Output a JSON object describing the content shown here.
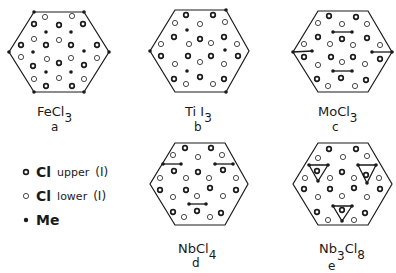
{
  "legend": {
    "items": [
      {
        "symbol": "bold-ring",
        "label_main": "Cl",
        "label_sub": "upper",
        "label_roman": "(I)"
      },
      {
        "symbol": "open-ring",
        "label_main": "Cl",
        "label_sub": "lower",
        "label_roman": "(I)"
      },
      {
        "symbol": "filled-dot",
        "label_main": "Me",
        "label_sub": "",
        "label_roman": ""
      }
    ]
  },
  "panels": [
    {
      "id": "a",
      "formula_main": "FeCl",
      "formula_sub": "3",
      "letter": "a",
      "origin": [
        0,
        0
      ],
      "hexagon": [
        [
          34,
          12
        ],
        [
          84,
          12
        ],
        [
          109,
          52
        ],
        [
          84,
          92
        ],
        [
          34,
          92
        ],
        [
          9,
          52
        ]
      ],
      "vertex_dots": [
        [
          34,
          12
        ],
        [
          84,
          12
        ],
        [
          109,
          52
        ],
        [
          84,
          92
        ],
        [
          34,
          92
        ],
        [
          9,
          52
        ]
      ],
      "bold": [
        [
          34,
          24
        ],
        [
          59,
          25
        ],
        [
          83,
          24
        ],
        [
          21,
          45
        ],
        [
          46,
          45
        ],
        [
          71,
          45
        ],
        [
          97,
          45
        ],
        [
          33,
          66
        ],
        [
          59,
          63
        ],
        [
          84,
          65
        ],
        [
          46,
          86
        ],
        [
          72,
          86
        ]
      ],
      "open": [
        [
          45,
          17
        ],
        [
          72,
          16
        ],
        [
          34,
          39
        ],
        [
          59,
          40
        ],
        [
          21,
          57
        ],
        [
          47,
          59
        ],
        [
          71,
          58
        ],
        [
          97,
          58
        ],
        [
          34,
          79
        ],
        [
          59,
          78
        ],
        [
          84,
          79
        ]
      ],
      "filled": [
        [
          46,
          32
        ],
        [
          71,
          32
        ],
        [
          33,
          52
        ],
        [
          84,
          51
        ],
        [
          46,
          72
        ],
        [
          71,
          72
        ]
      ],
      "bonds": [],
      "triangles": []
    },
    {
      "id": "b",
      "formula_main": "Ti I",
      "formula_sub": "3",
      "letter": "b",
      "origin": [
        140,
        0
      ],
      "hexagon": [
        [
          35,
          10
        ],
        [
          86,
          10
        ],
        [
          109,
          51
        ],
        [
          86,
          92
        ],
        [
          35,
          92
        ],
        [
          10,
          51
        ]
      ],
      "vertex_dots": [
        [
          86,
          10
        ],
        [
          10,
          51
        ],
        [
          86,
          92
        ]
      ],
      "bold": [
        [
          46,
          15
        ],
        [
          73,
          15
        ],
        [
          34,
          37
        ],
        [
          60,
          39
        ],
        [
          84,
          37
        ],
        [
          21,
          56
        ],
        [
          48,
          56
        ],
        [
          71,
          56
        ],
        [
          98,
          56
        ],
        [
          34,
          79
        ],
        [
          60,
          77
        ],
        [
          84,
          79
        ]
      ],
      "open": [
        [
          35,
          23
        ],
        [
          60,
          24
        ],
        [
          85,
          22
        ],
        [
          21,
          44
        ],
        [
          49,
          44
        ],
        [
          71,
          43
        ],
        [
          97,
          44
        ],
        [
          35,
          64
        ],
        [
          60,
          62
        ],
        [
          84,
          64
        ],
        [
          46,
          84
        ],
        [
          73,
          84
        ]
      ],
      "filled": [
        [
          47,
          30
        ],
        [
          85,
          50
        ],
        [
          47,
          71
        ]
      ],
      "bonds": [],
      "triangles": []
    },
    {
      "id": "c",
      "formula_main": "MoCl",
      "formula_sub": "3",
      "letter": "c",
      "origin": [
        285,
        0
      ],
      "hexagon": [
        [
          33,
          11
        ],
        [
          83,
          11
        ],
        [
          107,
          52
        ],
        [
          83,
          92
        ],
        [
          33,
          92
        ],
        [
          8,
          52
        ]
      ],
      "vertex_dots": [
        [
          8,
          52
        ],
        [
          107,
          52
        ]
      ],
      "bold": [
        [
          44,
          16
        ],
        [
          71,
          17
        ],
        [
          33,
          37
        ],
        [
          57,
          39
        ],
        [
          82,
          38
        ],
        [
          19,
          57
        ],
        [
          46,
          57
        ],
        [
          68,
          57
        ],
        [
          95,
          59
        ],
        [
          32,
          79
        ],
        [
          56,
          78
        ],
        [
          81,
          80
        ]
      ],
      "open": [
        [
          33,
          23
        ],
        [
          57,
          24
        ],
        [
          82,
          24
        ],
        [
          19,
          44
        ],
        [
          45,
          44
        ],
        [
          68,
          45
        ],
        [
          95,
          45
        ],
        [
          33,
          65
        ],
        [
          57,
          62
        ],
        [
          80,
          64
        ],
        [
          43,
          86
        ],
        [
          70,
          86
        ]
      ],
      "filled": [
        [
          48,
          32
        ],
        [
          67,
          32
        ],
        [
          27,
          51
        ],
        [
          87,
          52
        ],
        [
          48,
          71
        ],
        [
          67,
          71
        ]
      ],
      "bonds": [
        [
          [
            48,
            32
          ],
          [
            67,
            32
          ]
        ],
        [
          [
            8,
            52
          ],
          [
            27,
            51
          ]
        ],
        [
          [
            87,
            52
          ],
          [
            107,
            52
          ]
        ],
        [
          [
            48,
            71
          ],
          [
            67,
            71
          ]
        ]
      ],
      "triangles": []
    },
    {
      "id": "d",
      "formula_main": "NbCl",
      "formula_sub": "4",
      "letter": "d",
      "origin": [
        140,
        135
      ],
      "hexagon": [
        [
          35,
          8
        ],
        [
          85,
          8
        ],
        [
          108,
          49
        ],
        [
          85,
          90
        ],
        [
          35,
          90
        ],
        [
          10,
          49
        ]
      ],
      "vertex_dots": [],
      "bold": [
        [
          45,
          13
        ],
        [
          71,
          13
        ],
        [
          34,
          36
        ],
        [
          58,
          37
        ],
        [
          83,
          35
        ],
        [
          20,
          55
        ],
        [
          46,
          55
        ],
        [
          70,
          53
        ],
        [
          96,
          55
        ],
        [
          33,
          77
        ],
        [
          57,
          76
        ],
        [
          81,
          78
        ]
      ],
      "open": [
        [
          33,
          20
        ],
        [
          58,
          22
        ],
        [
          82,
          20
        ],
        [
          20,
          43
        ],
        [
          46,
          43
        ],
        [
          69,
          43
        ],
        [
          96,
          43
        ],
        [
          33,
          62
        ],
        [
          57,
          61
        ],
        [
          83,
          61
        ],
        [
          44,
          82
        ],
        [
          70,
          82
        ]
      ],
      "filled": [
        [
          23,
          29
        ],
        [
          41,
          29
        ],
        [
          75,
          29
        ],
        [
          93,
          29
        ],
        [
          49,
          69
        ],
        [
          66,
          69
        ]
      ],
      "bonds": [
        [
          [
            23,
            29
          ],
          [
            41,
            29
          ]
        ],
        [
          [
            75,
            29
          ],
          [
            93,
            29
          ]
        ],
        [
          [
            49,
            69
          ],
          [
            66,
            69
          ]
        ]
      ],
      "triangles": []
    },
    {
      "id": "e",
      "formula_main": "Nb",
      "formula_sub_mid": "3",
      "formula_main2": "Cl",
      "formula_sub": "8",
      "letter": "e",
      "origin": [
        285,
        135
      ],
      "hexagon": [
        [
          33,
          8
        ],
        [
          83,
          8
        ],
        [
          107,
          49
        ],
        [
          83,
          90
        ],
        [
          33,
          90
        ],
        [
          8,
          49
        ]
      ],
      "vertex_dots": [],
      "bold": [
        [
          44,
          14
        ],
        [
          71,
          14
        ],
        [
          32,
          36
        ],
        [
          57,
          37
        ],
        [
          81,
          40
        ],
        [
          19,
          54
        ],
        [
          45,
          54
        ],
        [
          69,
          53
        ],
        [
          95,
          54
        ],
        [
          32,
          77
        ],
        [
          57,
          75
        ],
        [
          80,
          78
        ]
      ],
      "open": [
        [
          33,
          23
        ],
        [
          58,
          22
        ],
        [
          82,
          21
        ],
        [
          20,
          43
        ],
        [
          45,
          43
        ],
        [
          69,
          43
        ],
        [
          94,
          43
        ],
        [
          33,
          62
        ],
        [
          57,
          61
        ],
        [
          82,
          62
        ],
        [
          43,
          85
        ],
        [
          69,
          85
        ]
      ],
      "filled": [],
      "bonds": [],
      "triangles": [
        [
          [
            24,
            30
          ],
          [
            43,
            30
          ],
          [
            33,
            46
          ]
        ],
        [
          [
            73,
            30
          ],
          [
            91,
            30
          ],
          [
            82,
            48
          ]
        ],
        [
          [
            48,
            71
          ],
          [
            67,
            71
          ],
          [
            57,
            86
          ]
        ]
      ]
    }
  ],
  "labels": [
    {
      "panel": "a",
      "formula_x": 37,
      "formula_y": 104,
      "letter_x": 52,
      "letter_y": 122
    },
    {
      "panel": "b",
      "formula_x": 186,
      "formula_y": 104,
      "letter_x": 195,
      "letter_y": 122
    },
    {
      "panel": "c",
      "formula_x": 318,
      "formula_y": 104,
      "letter_x": 332,
      "letter_y": 122
    },
    {
      "panel": "d",
      "formula_x": 178,
      "formula_y": 242,
      "letter_x": 192,
      "letter_y": 258
    },
    {
      "panel": "e",
      "formula_x": 319,
      "formula_y": 242,
      "letter_x": 326,
      "letter_y": 260
    }
  ],
  "colors": {
    "ink": "#1a1a1a",
    "background": "#ffffff"
  }
}
